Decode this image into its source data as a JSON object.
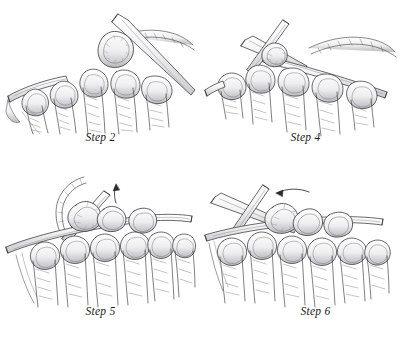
{
  "document": {
    "type": "instructional-illustration-sheet",
    "subject": "knitting technique steps",
    "style": "pen-and-ink line drawing with grey tonal shading",
    "background_color": "#ffffff",
    "ink_color": "#2a2a2a",
    "shade_light": "#e8e8ea",
    "shade_mid": "#c9c9ce",
    "shade_dark": "#9a9aa2",
    "layout": "2 columns x 2 rows",
    "width": 402,
    "height": 341
  },
  "panels": [
    {
      "id": "step-2",
      "caption": "Step 2",
      "row": 0,
      "column": 0,
      "description": "Two knitting needles crossed at the right; a loop of yarn is lifted over the right needle tip. A row of knit stitches hangs below on the left needle. A free yarn strand trails off to the upper right.",
      "needles": 2,
      "stitch_columns": 5,
      "has_arrow": false,
      "has_loose_yarn_strand": true
    },
    {
      "id": "step-4",
      "caption": "Step 4",
      "row": 0,
      "column": 1,
      "description": "Needles crossed near the centre top with the working needle passing through the stitches; a long yarn strand sweeps off to the right. Five knit stitch columns hang below.",
      "needles": 2,
      "stitch_columns": 5,
      "has_arrow": false,
      "has_loose_yarn_strand": true
    },
    {
      "id": "step-5",
      "caption": "Step 5",
      "row": 1,
      "column": 0,
      "description": "A taller block of knitted fabric on the needle. A curved yarn strand loops up and over at the upper left, and a small curved arrow at the top centre points upward showing the direction to lift the stitch.",
      "needles": 2,
      "stitch_columns": 6,
      "has_arrow": true,
      "arrow_direction": "up",
      "has_loose_yarn_strand": true
    },
    {
      "id": "step-6",
      "caption": "Step 6",
      "row": 1,
      "column": 1,
      "description": "The completed block of knitted fabric with needles crossed above it. A short horizontal arrow at the top points to the right, showing the finished stitch being moved across.",
      "needles": 2,
      "stitch_columns": 6,
      "has_arrow": true,
      "arrow_direction": "right",
      "has_loose_yarn_strand": false
    }
  ]
}
